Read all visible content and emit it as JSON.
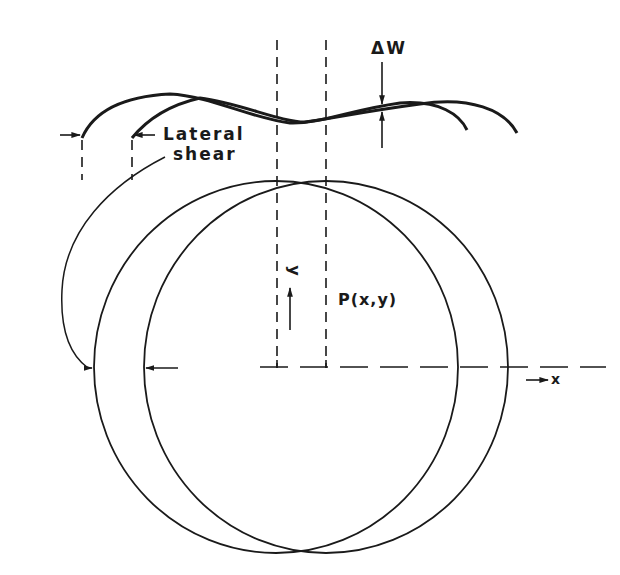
{
  "diagram": {
    "type": "lateral-shear-interferometry",
    "labels": {
      "delta_w": "ΔW",
      "lateral_line1": "Lateral",
      "lateral_line2": "shear",
      "y_axis": "y",
      "x_axis": "x",
      "point": "P(x,y)"
    },
    "elements": {
      "original_wavefront": "curve A (left)",
      "sheared_wavefront": "curve B (right, shifted by lateral shear)",
      "circles": [
        "original aperture",
        "sheared aperture"
      ]
    },
    "colors": {
      "stroke": "#1a1a1a",
      "background": "#ffffff"
    }
  }
}
